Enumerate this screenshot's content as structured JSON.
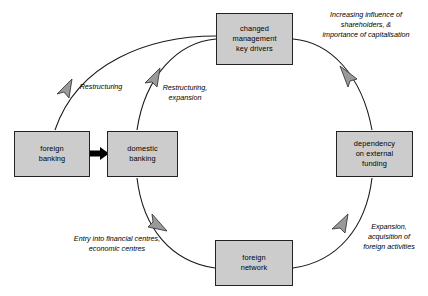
{
  "diagram": {
    "colors": {
      "box_fill": "#cccccc",
      "box_border": "#222222",
      "arc_stroke": "#1a1a1a",
      "arrowhead_fill": "#9a9a9a",
      "arrowhead_stroke": "#3a3a3a",
      "solid_arrow_fill": "#000000",
      "background": "#ffffff"
    },
    "nodes": [
      {
        "id": "changed-management",
        "name": "changed-management-key-drivers",
        "lines": [
          "changed",
          "management",
          "key drivers"
        ],
        "x": 216,
        "y": 13,
        "w": 77,
        "h": 52
      },
      {
        "id": "dependency-external-funding",
        "name": "dependency-on-external-funding",
        "lines": [
          "dependency",
          "on external",
          "funding"
        ],
        "x": 336,
        "y": 131,
        "w": 77,
        "h": 46
      },
      {
        "id": "foreign-network",
        "name": "foreign-network",
        "lines": [
          "foreign",
          "network"
        ],
        "x": 215,
        "y": 240,
        "w": 78,
        "h": 46
      },
      {
        "id": "domestic-banking",
        "name": "domestic-banking",
        "lines": [
          "domestic",
          "banking"
        ],
        "x": 107,
        "y": 131,
        "w": 71,
        "h": 46
      },
      {
        "id": "foreign-banking",
        "name": "foreign-banking",
        "lines": [
          "foreign",
          "banking"
        ],
        "x": 14,
        "y": 131,
        "w": 76,
        "h": 46
      }
    ],
    "edge_labels": [
      {
        "id": "increasing-influence",
        "name": "edge-label-increasing-influence",
        "lines": [
          "Increasing influence of",
          "shareholders, &",
          "importance of capitalisation"
        ],
        "x": 306,
        "y": 10,
        "w": 120
      },
      {
        "id": "expansion-acquisition",
        "name": "edge-label-expansion-acquisition",
        "lines": [
          "Expansion,",
          "acquisition of",
          "foreign activities"
        ],
        "x": 352,
        "y": 222,
        "w": 74
      },
      {
        "id": "entry-into-financial-centres",
        "name": "edge-label-entry-into-financial-centres",
        "lines": [
          "Entry into financial centres,",
          "economic centres"
        ],
        "x": 58,
        "y": 234,
        "w": 118
      },
      {
        "id": "restructuring-expansion",
        "name": "edge-label-restructuring-expansion",
        "lines": [
          "Restructuring,",
          "expansion"
        ],
        "x": 157,
        "y": 83,
        "w": 56
      },
      {
        "id": "restructuring",
        "name": "edge-label-restructuring",
        "lines": [
          "Restructuring"
        ],
        "x": 72,
        "y": 82,
        "w": 58
      }
    ],
    "connections": [
      {
        "from": "changed-management",
        "to": "dependency-external-funding",
        "direction": "counterclockwise"
      },
      {
        "from": "dependency-external-funding",
        "to": "foreign-network",
        "direction": "counterclockwise"
      },
      {
        "from": "foreign-network",
        "to": "domestic-banking",
        "direction": "counterclockwise"
      },
      {
        "from": "domestic-banking",
        "to": "changed-management",
        "direction": "counterclockwise"
      },
      {
        "from": "changed-management",
        "to": "foreign-banking",
        "direction": "outer-arc"
      },
      {
        "from": "foreign-banking",
        "to": "domestic-banking",
        "direction": "straight-solid"
      }
    ]
  }
}
